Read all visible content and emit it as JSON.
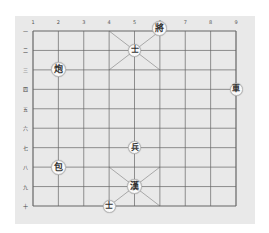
{
  "board": {
    "columns": 9,
    "rows": 10,
    "grid": {
      "left": 33,
      "top": 31,
      "right": 236,
      "bottom": 206
    },
    "colors": {
      "background": "#e9e9e9",
      "line": "#666666",
      "piece_bg": "#fafafa",
      "piece_text": "#333333"
    },
    "column_labels": [
      "1",
      "2",
      "3",
      "4",
      "5",
      "6",
      "7",
      "8",
      "9"
    ],
    "row_labels": [
      "一",
      "二",
      "三",
      "四",
      "五",
      "六",
      "七",
      "八",
      "九",
      "十"
    ]
  },
  "pieces": [
    {
      "glyph": "將",
      "name": "general",
      "col": 6,
      "row": 1,
      "big": true
    },
    {
      "glyph": "士",
      "name": "advisor",
      "col": 5,
      "row": 2
    },
    {
      "glyph": "炮",
      "name": "cannon",
      "col": 2,
      "row": 3,
      "big": true
    },
    {
      "glyph": "車",
      "name": "chariot",
      "col": 9,
      "row": 4
    },
    {
      "glyph": "兵",
      "name": "soldier",
      "col": 5,
      "row": 7
    },
    {
      "glyph": "包",
      "name": "cannon",
      "col": 2,
      "row": 8,
      "big": true
    },
    {
      "glyph": "漢",
      "name": "king",
      "col": 5,
      "row": 9,
      "big": true
    },
    {
      "glyph": "士",
      "name": "advisor",
      "col": 4,
      "row": 10
    }
  ]
}
